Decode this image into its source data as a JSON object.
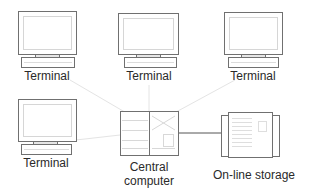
{
  "diagram": {
    "type": "network-topology",
    "nodes": [
      {
        "id": "terminal-1",
        "kind": "terminal",
        "label": "Terminal"
      },
      {
        "id": "terminal-2",
        "kind": "terminal",
        "label": "Terminal"
      },
      {
        "id": "terminal-3",
        "kind": "terminal",
        "label": "Terminal"
      },
      {
        "id": "terminal-4",
        "kind": "terminal",
        "label": "Terminal"
      },
      {
        "id": "central-computer",
        "kind": "computer",
        "label_line1": "Central",
        "label_line2": "computer"
      },
      {
        "id": "online-storage",
        "kind": "storage",
        "label": "On-line storage"
      }
    ],
    "edges": [
      {
        "from": "central-computer",
        "to": "terminal-1",
        "style": "faint"
      },
      {
        "from": "central-computer",
        "to": "terminal-2",
        "style": "faint"
      },
      {
        "from": "central-computer",
        "to": "terminal-3",
        "style": "faint"
      },
      {
        "from": "central-computer",
        "to": "terminal-4",
        "style": "faint"
      },
      {
        "from": "central-computer",
        "to": "online-storage",
        "style": "solid"
      }
    ],
    "colors": {
      "outline": "#6e6e6e",
      "faint_link": "#e2e2e2",
      "solid_link": "#555555",
      "text": "#2a2a2a"
    }
  }
}
